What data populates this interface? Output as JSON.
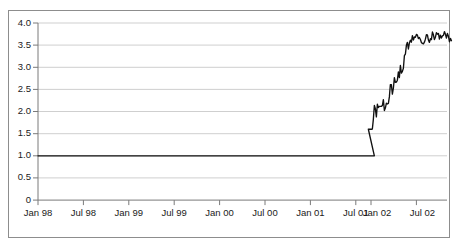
{
  "chart_data": {
    "type": "line",
    "title": "",
    "subtitle": "",
    "xlabel": "",
    "ylabel": "",
    "legend": [],
    "legend_position": "none",
    "grid": true,
    "grid_axis": "y",
    "ylim": [
      0,
      4.0
    ],
    "yticks": [
      0,
      0.5,
      1.0,
      1.5,
      2.0,
      2.5,
      3.0,
      3.5,
      4.0
    ],
    "ytick_labels": [
      "0",
      "0.5",
      "1.0",
      "1.5",
      "2.0",
      "2.5",
      "3.0",
      "3.5",
      "4.0"
    ],
    "xtick_labels": [
      "Jan 98",
      "Jul 98",
      "Jan 99",
      "Jul 99",
      "Jan 00",
      "Jul 00",
      "Jan 01",
      "Jul 01",
      "Jan 02",
      "Jul 02"
    ],
    "xlim_labels": [
      "Jan 98",
      "Dec 02"
    ],
    "series": [
      {
        "name": "index",
        "color": "#111111",
        "x": [
          "Jan 98",
          "Feb 98",
          "Mar 98",
          "Apr 98",
          "May 98",
          "Jun 98",
          "Jul 98",
          "Aug 98",
          "Sep 98",
          "Oct 98",
          "Nov 98",
          "Dec 98",
          "Jan 99",
          "Feb 99",
          "Mar 99",
          "Apr 99",
          "May 99",
          "Jun 99",
          "Jul 99",
          "Aug 99",
          "Sep 99",
          "Oct 99",
          "Nov 99",
          "Dec 99",
          "Jan 00",
          "Feb 00",
          "Mar 00",
          "Apr 00",
          "May 00",
          "Jun 00",
          "Jul 00",
          "Aug 00",
          "Sep 00",
          "Oct 00",
          "Nov 00",
          "Dec 00",
          "Jan 01",
          "Feb 01",
          "Mar 01",
          "Apr 01",
          "May 01",
          "Jun 01",
          "Jul 01",
          "Aug 01",
          "Sep 01",
          "Oct 01",
          "Nov 01",
          "Dec 01",
          "Jan 02",
          "Feb 02",
          "Mar 02",
          "Apr 02",
          "May 02",
          "Jun 02",
          "Jul 02",
          "Aug 02",
          "Sep 02",
          "Oct 02",
          "Nov 02",
          "Dec 02"
        ],
        "values": [
          1.0,
          1.0,
          1.0,
          1.0,
          1.0,
          1.0,
          1.0,
          1.0,
          1.0,
          1.0,
          1.0,
          1.0,
          1.0,
          1.0,
          1.0,
          1.0,
          1.0,
          1.0,
          1.0,
          1.0,
          1.0,
          1.0,
          1.0,
          1.0,
          1.0,
          1.0,
          1.0,
          1.0,
          1.0,
          1.0,
          1.0,
          1.0,
          1.0,
          1.0,
          1.0,
          1.0,
          1.0,
          1.0,
          1.0,
          1.0,
          1.0,
          1.0,
          1.0,
          1.0,
          1.0,
          1.0,
          1.0,
          1.0,
          2.05,
          2.0,
          2.35,
          2.7,
          3.05,
          3.55,
          3.7,
          3.6,
          3.68,
          3.72,
          3.7,
          3.6
        ],
        "notes": "Flat at 1.0 from Jan 98 through Dec 01, vertical jump at Jan 02 to ~2.05, volatile climb to peak ~3.90 in Jun 02, then plateau 3.5-3.8, ending ~3.62"
      }
    ],
    "annotations": [
      {
        "label": "step jump",
        "x": "Jan 02",
        "from": 1.0,
        "to": 2.05
      },
      {
        "label": "peak",
        "x": "Jun 02",
        "value": 3.9
      },
      {
        "label": "final",
        "x": "Dec 02",
        "value": 3.62
      }
    ]
  }
}
